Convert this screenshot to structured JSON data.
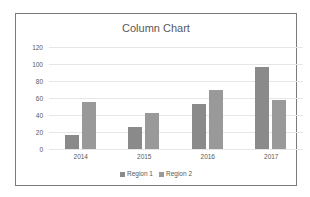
{
  "chart_data": {
    "type": "bar",
    "title": "Column Chart",
    "xlabel": "",
    "ylabel": "",
    "categories": [
      "2014",
      "2015",
      "2016",
      "2017"
    ],
    "series": [
      {
        "name": "Region 1",
        "values": [
          17,
          26,
          53,
          96
        ],
        "color": "#8a8a8a"
      },
      {
        "name": "Region 2",
        "values": [
          55,
          42,
          70,
          58
        ],
        "color": "#999999"
      }
    ],
    "ylim": [
      0,
      120
    ],
    "yticks": [
      "0",
      "20",
      "40",
      "60",
      "80",
      "100",
      "120"
    ],
    "grid": true,
    "legend_position": "bottom"
  }
}
